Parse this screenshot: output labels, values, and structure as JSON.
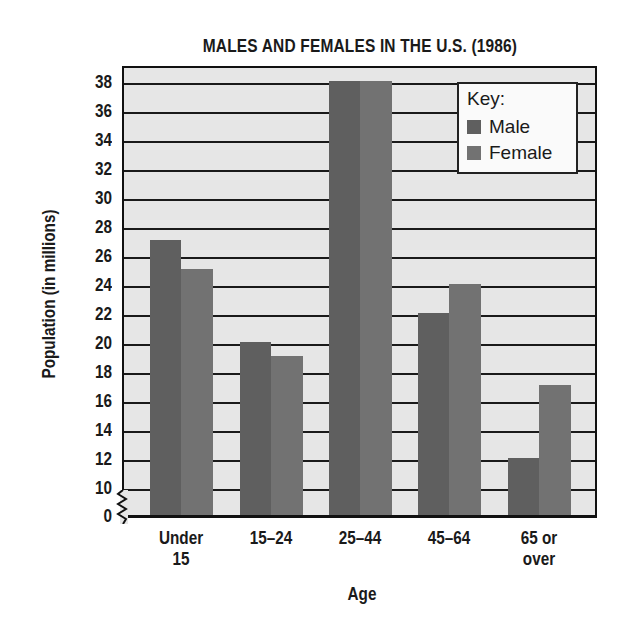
{
  "chart_data": {
    "type": "bar",
    "title": "MALES AND FEMALES IN THE U.S. (1986)",
    "xlabel": "Age",
    "ylabel": "Population (in millions)",
    "categories": [
      "Under 15",
      "15–24",
      "25–44",
      "45–64",
      "65 or over"
    ],
    "category_lines": [
      [
        "Under",
        "15"
      ],
      [
        "15–24"
      ],
      [
        "25–44"
      ],
      [
        "45–64"
      ],
      [
        "65 or",
        "over"
      ]
    ],
    "series": [
      {
        "name": "Male",
        "values": [
          27,
          20,
          38,
          22,
          12
        ],
        "color": "#5f5f5f"
      },
      {
        "name": "Female",
        "values": [
          25,
          19,
          38,
          24,
          17
        ],
        "color": "#727272"
      }
    ],
    "yticks": [
      0,
      10,
      12,
      14,
      16,
      18,
      20,
      22,
      24,
      26,
      28,
      30,
      32,
      34,
      36,
      38
    ],
    "ylim": [
      0,
      39
    ],
    "axis_break": "between 0 and 10",
    "grid": true,
    "legend": {
      "title": "Key:",
      "position": "top-right",
      "entries": [
        "Male",
        "Female"
      ]
    }
  },
  "colors": {
    "plot_bg": "#e6e6e6",
    "male": "#5f5f5f",
    "female": "#727272",
    "ink": "#1a1a1a"
  }
}
